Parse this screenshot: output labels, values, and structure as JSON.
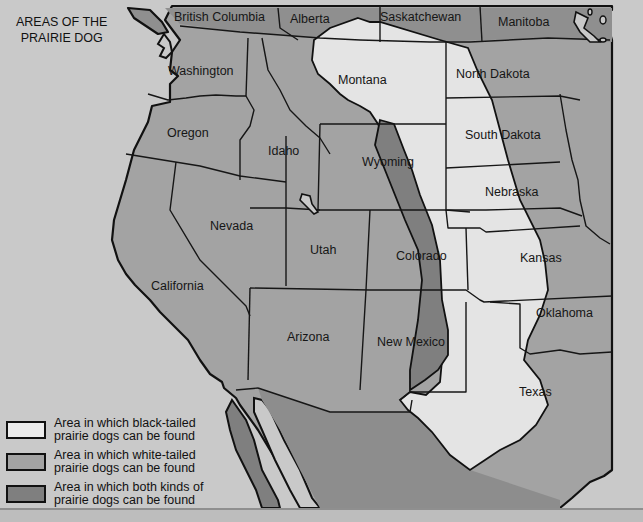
{
  "title": {
    "line1": "AREAS OF THE",
    "line2": "PRAIRIE DOG"
  },
  "colors": {
    "background": "#c9c9c9",
    "black_tailed": "#e4e4e4",
    "white_tailed": "#a3a3a3",
    "both": "#7f7f7f",
    "border": "#161616"
  },
  "regions": {
    "british_columbia": "British Columbia",
    "alberta": "Alberta",
    "saskatchewan": "Saskatchewan",
    "manitoba": "Manitoba",
    "washington": "Washington",
    "oregon": "Oregon",
    "idaho": "Idaho",
    "montana": "Montana",
    "north_dakota": "North Dakota",
    "south_dakota": "South Dakota",
    "wyoming": "Wyoming",
    "nebraska": "Nebraska",
    "nevada": "Nevada",
    "utah": "Utah",
    "colorado": "Colorado",
    "kansas": "Kansas",
    "california": "California",
    "arizona": "Arizona",
    "new_mexico": "New Mexico",
    "oklahoma": "Oklahoma",
    "texas": "Texas"
  },
  "legend": [
    {
      "key": "black_tailed",
      "line1": "Area in which black-tailed",
      "line2": "prairie dogs can be found"
    },
    {
      "key": "white_tailed",
      "line1": "Area in which white-tailed",
      "line2": "prairie dogs can be found"
    },
    {
      "key": "both",
      "line1": "Area in which both kinds of",
      "line2": "prairie dogs can be found"
    }
  ]
}
